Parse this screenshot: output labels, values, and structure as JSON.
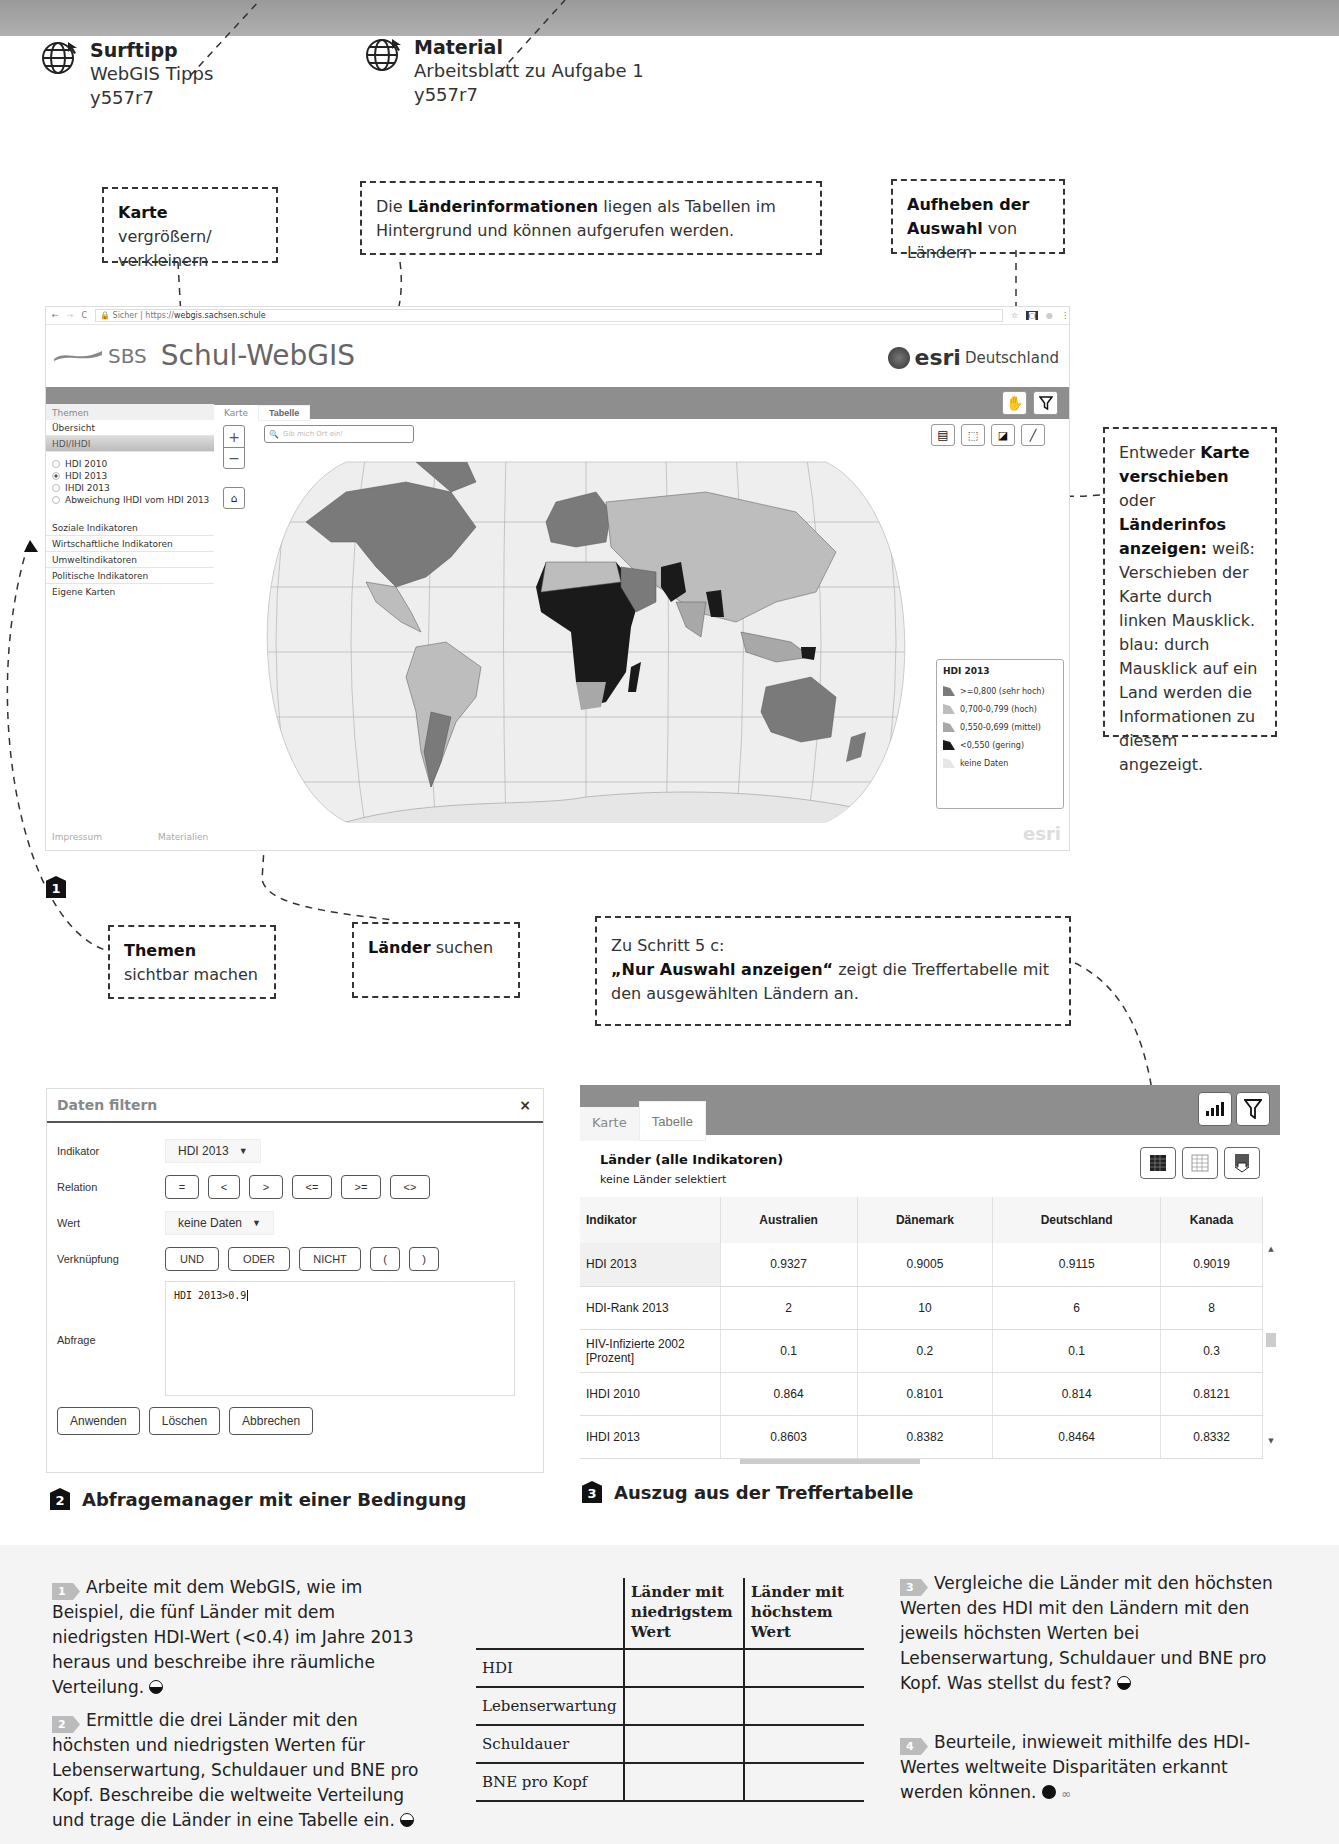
{
  "links": [
    {
      "label": "Surftipp",
      "desc": "WebGIS Tipps",
      "code": "y557r7"
    },
    {
      "label": "Material",
      "desc": "Arbeitsblatt zu Aufgabe 1",
      "code": "y557r7"
    }
  ],
  "callouts": {
    "zoom": {
      "bold": "Karte",
      "text": " vergrößern/ verkleinern"
    },
    "tables": {
      "pre": "Die ",
      "bold": "Länderinformationen",
      "text": " liegen als Tabellen im Hintergrund und können aufgerufen werden."
    },
    "deselect": {
      "bold": "Aufheben der Auswahl",
      "text": " von Ländern"
    },
    "pan": {
      "pre": "Entweder ",
      "bold1": "Karte verschieben",
      "mid": " oder ",
      "bold2": "Länderinfos anzeigen:",
      "text": " weiß: Verschieben der Karte durch linken Mausklick. blau: durch Mausklick auf ein Land werden die Informationen zu diesem angezeigt."
    },
    "themes": {
      "bold": "Themen",
      "text": " sichtbar machen"
    },
    "search": {
      "bold": "Länder",
      "text": " suchen"
    },
    "step": {
      "line1": "Zu Schritt 5 c:",
      "bold": "„Nur Auswahl anzeigen“",
      "text": " zeigt die Treffertabelle mit den ausgewählten Ländern an."
    }
  },
  "webgis": {
    "browser": {
      "secure": "Sicher",
      "url_prefix": "https://",
      "url": "webgis.sachsen.schule"
    },
    "logo_small": "SBS",
    "title": "Schul-WebGIS",
    "partner_brand": "esri",
    "partner_name": "Deutschland",
    "sidebar": {
      "header": "Themen",
      "overview": "Übersicht",
      "active_group": "HDI/IHDI",
      "radios": [
        {
          "label": "HDI 2010",
          "checked": false
        },
        {
          "label": "HDI 2013",
          "checked": true
        },
        {
          "label": "IHDI 2013",
          "checked": false
        },
        {
          "label": "Abweichung IHDI vom HDI 2013",
          "checked": false
        }
      ],
      "groups": [
        "Soziale Indikatoren",
        "Wirtschaftliche Indikatoren",
        "Umweltindikatoren",
        "Politische Indikatoren",
        "Eigene Karten"
      ],
      "footer_left": "Impressum",
      "footer_right": "Materialien"
    },
    "tabs": [
      "Karte",
      "Tabelle"
    ],
    "search_placeholder": "Gib mich Ort ein!",
    "legend": {
      "title": "HDI 2013",
      "items": [
        {
          "label": ">=0,800 (sehr hoch)",
          "color": "#7a7a7a"
        },
        {
          "label": "0,700-0,799 (hoch)",
          "color": "#bdbdbd"
        },
        {
          "label": "0,550-0,699 (mittel)",
          "color": "#a8a8a8"
        },
        {
          "label": "<0,550 (gering)",
          "color": "#1a1a1a"
        },
        {
          "label": "keine Daten",
          "color": "#e6e6e6"
        }
      ]
    },
    "watermark": "esri"
  },
  "figure1_number": "1",
  "filter_dialog": {
    "title": "Daten filtern",
    "close": "×",
    "indikator_label": "Indikator",
    "indikator_value": "HDI 2013",
    "relation_label": "Relation",
    "relations": [
      "=",
      "<",
      ">",
      "<=",
      ">=",
      "<>"
    ],
    "wert_label": "Wert",
    "wert_value": "keine Daten",
    "verknuepfung_label": "Verknüpfung",
    "verknuepfungen": [
      "UND",
      "ODER",
      "NICHT",
      "(",
      ")"
    ],
    "abfrage_label": "Abfrage",
    "abfrage_value": "HDI 2013>0.9",
    "actions": [
      "Anwenden",
      "Löschen",
      "Abbrechen"
    ]
  },
  "figure2": {
    "number": "2",
    "caption": "Abfragemanager mit einer Bedingung"
  },
  "result_table": {
    "tabs": [
      "Karte",
      "Tabelle"
    ],
    "title": "Länder (alle Indikatoren)",
    "subtitle": "keine Länder selektiert",
    "columns": [
      "Indikator",
      "Australien",
      "Dänemark",
      "Deutschland",
      "Kanada"
    ],
    "rows": [
      [
        "HDI 2013",
        "0.9327",
        "0.9005",
        "0.9115",
        "0.9019"
      ],
      [
        "HDI-Rank 2013",
        "2",
        "10",
        "6",
        "8"
      ],
      [
        "HIV-Infizierte 2002 [Prozent]",
        "0.1",
        "0.2",
        "0.1",
        "0.3"
      ],
      [
        "IHDI 2010",
        "0.864",
        "0.8101",
        "0.814",
        "0.8121"
      ],
      [
        "IHDI 2013",
        "0.8603",
        "0.8382",
        "0.8464",
        "0.8332"
      ]
    ]
  },
  "figure3": {
    "number": "3",
    "caption": "Auszug aus der Treffertabelle"
  },
  "tasks": [
    {
      "num": "1",
      "text": "Arbeite mit dem WebGIS, wie im Beispiel, die fünf Länder mit dem niedrigsten HDI-Wert (<0.4) im Jahre 2013 heraus und beschreibe ihre räumliche Verteilung.",
      "level": "half"
    },
    {
      "num": "2",
      "text": "Ermittle die drei Länder mit den höchsten und niedrigsten Werten für Lebenserwartung, Schuldauer und BNE pro Kopf. Beschreibe die weltweite Verteilung und trage die Länder in eine Tabelle ein.",
      "level": "half"
    },
    {
      "num": "3",
      "text": "Vergleiche die Länder mit den höchsten Werten des HDI mit den Ländern mit den jeweils höchsten Werten bei Lebenserwartung, Schuldauer und BNE pro Kopf. Was stellst du fest?",
      "level": "half"
    },
    {
      "num": "4",
      "text": "Beurteile, inwieweit mithilfe des HDI-Wertes weltweite Disparitäten erkannt werden können.",
      "level": "full"
    }
  ],
  "worksheet_table": {
    "columns": [
      "",
      "Länder mit niedrigstem Wert",
      "Länder mit höchstem Wert"
    ],
    "rows": [
      "HDI",
      "Lebenserwartung",
      "Schuldauer",
      "BNE pro Kopf"
    ]
  }
}
